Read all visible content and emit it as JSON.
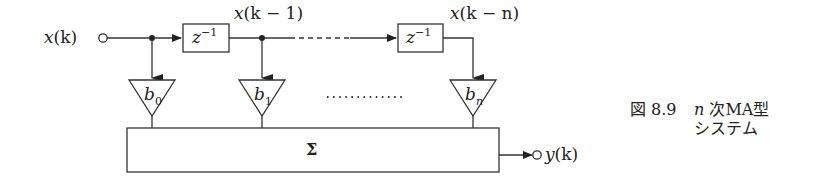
{
  "diagram": {
    "type": "block-diagram",
    "input": {
      "label_main": "x",
      "label_arg": "(k)"
    },
    "output": {
      "label_main": "y",
      "label_arg": "(k)"
    },
    "taps": [
      {
        "label_main": "x",
        "label_arg": "(k − 1)"
      },
      {
        "label_main": "x",
        "label_arg": "(k − n)"
      }
    ],
    "delays": [
      {
        "base": "z",
        "exp": "−1"
      },
      {
        "base": "z",
        "exp": "−1"
      }
    ],
    "gains": [
      {
        "base": "b",
        "sub": "0"
      },
      {
        "base": "b",
        "sub": "1"
      },
      {
        "base": "b",
        "sub": "n"
      }
    ],
    "summer": {
      "symbol": "Σ"
    },
    "ellipsis": "............",
    "colors": {
      "stroke": "#333333",
      "background": "#ffffff"
    }
  },
  "caption": {
    "figure_number": "図 8.9",
    "line1_var": "n",
    "line1_text": " 次MA型",
    "line2_text": "システム"
  }
}
